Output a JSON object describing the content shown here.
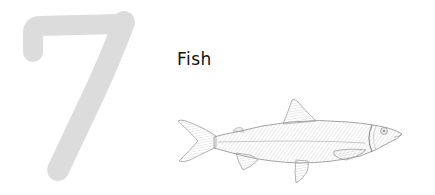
{
  "numeral": {
    "value": "7",
    "color": "#dcdcdc"
  },
  "title": {
    "text": "Fish"
  },
  "illustration": {
    "subject": "fish",
    "style": "engraved line drawing",
    "stroke_color": "#9a9a9a",
    "fill_color": "#efefef"
  },
  "colors": {
    "background": "#ffffff",
    "text": "#111111"
  }
}
